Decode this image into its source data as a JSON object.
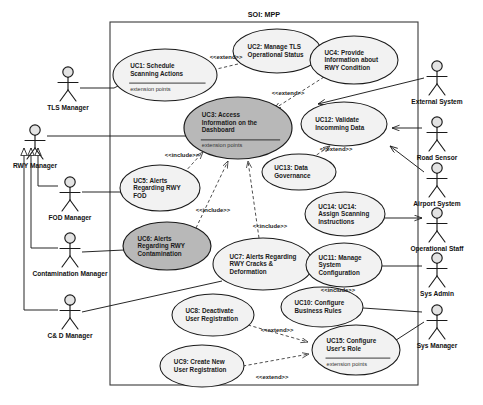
{
  "diagram": {
    "title": "SOI: MPP",
    "boundary": {
      "x": 110,
      "y": 22,
      "width": 308,
      "height": 363
    }
  },
  "actors": [
    {
      "id": "tls-manager",
      "label": "TLS Manager",
      "x": 68,
      "y": 72,
      "side": "left"
    },
    {
      "id": "rwy-manager",
      "label": "RWY Manager",
      "x": 35,
      "y": 130,
      "side": "left"
    },
    {
      "id": "fod-manager",
      "label": "FOD Manager",
      "x": 70,
      "y": 182,
      "side": "left"
    },
    {
      "id": "contamination-manager",
      "label": "Contamination Manager",
      "x": 70,
      "y": 238,
      "side": "left"
    },
    {
      "id": "cd-manager",
      "label": "C& D  Manager",
      "x": 70,
      "y": 300,
      "side": "left"
    },
    {
      "id": "external-system",
      "label": "External System",
      "x": 437,
      "y": 66,
      "side": "right"
    },
    {
      "id": "road-sensor",
      "label": "Road Sensor",
      "x": 437,
      "y": 122,
      "side": "right"
    },
    {
      "id": "airport-system",
      "label": "Airport System",
      "x": 437,
      "y": 168,
      "side": "right"
    },
    {
      "id": "operational-staff",
      "label": "Operational Staff",
      "x": 437,
      "y": 213,
      "side": "right"
    },
    {
      "id": "sys-admin",
      "label": "Sys Admin",
      "x": 437,
      "y": 258,
      "side": "right"
    },
    {
      "id": "sys-manager",
      "label": "Sys Manager",
      "x": 437,
      "y": 310,
      "side": "right"
    }
  ],
  "usecases": [
    {
      "id": "uc1",
      "lines": [
        "UC1: Schedule",
        "Scanning Actions"
      ],
      "note": "extension points",
      "shaded": false,
      "cx": 165,
      "cy": 75,
      "rx": 52,
      "ry": 26
    },
    {
      "id": "uc2",
      "lines": [
        "UC2: Manage TLS",
        "Operational Status"
      ],
      "note": "",
      "shaded": false,
      "cx": 277,
      "cy": 51,
      "rx": 44,
      "ry": 22
    },
    {
      "id": "uc3",
      "lines": [
        "UC3: Access",
        "Information on the",
        "Dashboard"
      ],
      "note": "extension points",
      "shaded": true,
      "cx": 238,
      "cy": 128,
      "rx": 54,
      "ry": 31
    },
    {
      "id": "uc4",
      "lines": [
        "UC4: Provide",
        "Information about",
        "RWY Condition"
      ],
      "note": "",
      "shaded": false,
      "cx": 354,
      "cy": 60,
      "rx": 44,
      "ry": 24
    },
    {
      "id": "uc5",
      "lines": [
        "UC5: Alerts",
        "Regarding RWY",
        "FOD"
      ],
      "note": "",
      "shaded": false,
      "cx": 160,
      "cy": 188,
      "rx": 40,
      "ry": 23
    },
    {
      "id": "uc6",
      "lines": [
        "UC6: Alerts",
        "Regarding RWY",
        "Contamination"
      ],
      "note": "",
      "shaded": true,
      "cx": 167,
      "cy": 246,
      "rx": 44,
      "ry": 24
    },
    {
      "id": "uc7",
      "lines": [
        "UC7: Alerts Regarding",
        "RWY Cracks &",
        "Deformation"
      ],
      "note": "",
      "shaded": false,
      "cx": 263,
      "cy": 264,
      "rx": 50,
      "ry": 26
    },
    {
      "id": "uc8",
      "lines": [
        "UC8: Deactivate",
        "User Registration"
      ],
      "note": "",
      "shaded": false,
      "cx": 213,
      "cy": 315,
      "rx": 41,
      "ry": 21
    },
    {
      "id": "uc9",
      "lines": [
        "UC9: Create New",
        "User Registration"
      ],
      "note": "",
      "shaded": false,
      "cx": 202,
      "cy": 366,
      "rx": 42,
      "ry": 21
    },
    {
      "id": "uc10",
      "lines": [
        "UC10: Configure",
        "Business Rules"
      ],
      "note": "",
      "shaded": false,
      "cx": 322,
      "cy": 307,
      "rx": 41,
      "ry": 20
    },
    {
      "id": "uc11",
      "lines": [
        "UC11: Manage",
        "System",
        "Configuration"
      ],
      "note": "",
      "shaded": false,
      "cx": 344,
      "cy": 265,
      "rx": 38,
      "ry": 22
    },
    {
      "id": "uc12",
      "lines": [
        "UC12: Validate",
        "Incomming Data"
      ],
      "note": "",
      "shaded": false,
      "cx": 344,
      "cy": 124,
      "rx": 43,
      "ry": 22
    },
    {
      "id": "uc13",
      "lines": [
        "UC13: Data",
        "Governance"
      ],
      "note": "",
      "shaded": false,
      "cx": 299,
      "cy": 172,
      "rx": 37,
      "ry": 18
    },
    {
      "id": "uc14",
      "lines": [
        "UC14: UC14:",
        "Assign Scanning",
        "Instructions"
      ],
      "note": "",
      "shaded": false,
      "cx": 345,
      "cy": 214,
      "rx": 40,
      "ry": 22
    },
    {
      "id": "uc15",
      "lines": [
        "UC15: Configure",
        "User's Role"
      ],
      "note": "extension points",
      "shaded": false,
      "cx": 356,
      "cy": 350,
      "rx": 44,
      "ry": 25
    }
  ],
  "stereotypes": [
    {
      "id": "ext-uc2-uc1",
      "label": "<<extend>>",
      "x": 226,
      "y": 59
    },
    {
      "id": "ext-uc4-uc3",
      "label": "<<extend>>",
      "x": 288,
      "y": 95
    },
    {
      "id": "inc-uc5-uc3",
      "label": "<<include>>",
      "x": 182,
      "y": 157
    },
    {
      "id": "inc-uc6-uc3",
      "label": "<<include>>",
      "x": 213,
      "y": 212
    },
    {
      "id": "inc-uc7-uc3",
      "label": "<<include>>",
      "x": 270,
      "y": 228
    },
    {
      "id": "ext-uc13-uc12",
      "label": "<<extend>>",
      "x": 336,
      "y": 151
    },
    {
      "id": "inc-uc10-uc11",
      "label": "<<include>>",
      "x": 338,
      "y": 292
    },
    {
      "id": "ext-uc8-uc15",
      "label": "<<extend>>",
      "x": 277,
      "y": 332
    },
    {
      "id": "ext-uc9-uc15",
      "label": "<<extend>>",
      "x": 272,
      "y": 379
    }
  ],
  "colors": {
    "shaded_fill": "#b8b8b8",
    "plain_fill": "#f2f2f2",
    "stroke": "#1a1a1a",
    "boundary": "#3a3a3a",
    "background": "#ffffff"
  }
}
